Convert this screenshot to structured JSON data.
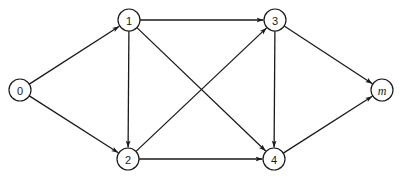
{
  "diagram": {
    "type": "directed-graph",
    "colors": {
      "stroke": "#1a1a1a",
      "background": "#ffffff"
    },
    "nodes": [
      {
        "id": "0",
        "label": "0",
        "x": 20,
        "y": 90,
        "italic": false
      },
      {
        "id": "1",
        "label": "1",
        "x": 129,
        "y": 20,
        "italic": false
      },
      {
        "id": "2",
        "label": "2",
        "x": 128,
        "y": 159,
        "italic": false
      },
      {
        "id": "3",
        "label": "3",
        "x": 275,
        "y": 20,
        "italic": false
      },
      {
        "id": "4",
        "label": "4",
        "x": 274,
        "y": 159,
        "italic": false
      },
      {
        "id": "m",
        "label": "m",
        "x": 382,
        "y": 90,
        "italic": true
      }
    ],
    "edges": [
      {
        "from": "0",
        "to": "1"
      },
      {
        "from": "0",
        "to": "2"
      },
      {
        "from": "1",
        "to": "3"
      },
      {
        "from": "1",
        "to": "2"
      },
      {
        "from": "1",
        "to": "4"
      },
      {
        "from": "2",
        "to": "3"
      },
      {
        "from": "2",
        "to": "4"
      },
      {
        "from": "3",
        "to": "4"
      },
      {
        "from": "3",
        "to": "m"
      },
      {
        "from": "4",
        "to": "m"
      }
    ],
    "node_radius": 11
  }
}
